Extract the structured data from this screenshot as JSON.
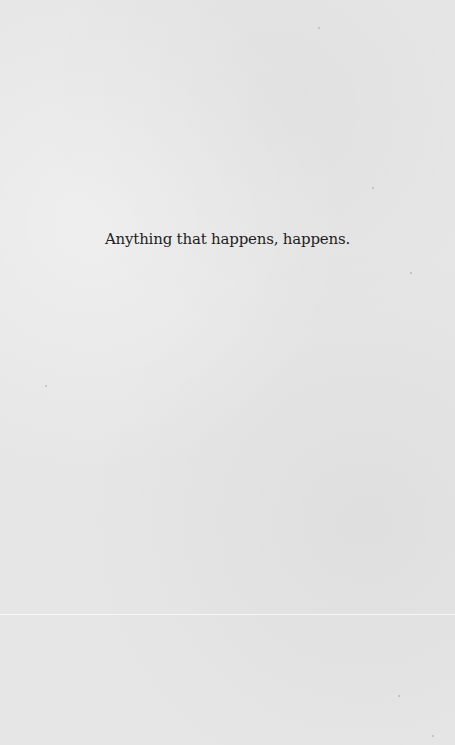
{
  "page": {
    "epigraph": "Anything that happens, happens.",
    "background_color": "#e6e6e6",
    "text_color": "#1e1e1e"
  }
}
